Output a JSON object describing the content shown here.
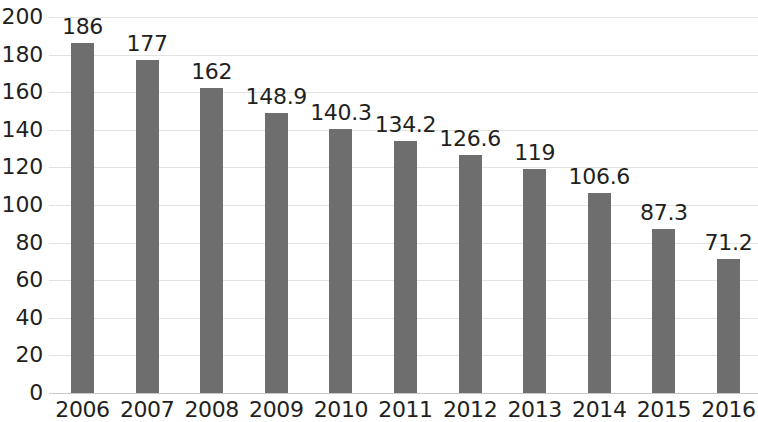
{
  "chart_data": {
    "type": "bar",
    "title": "",
    "subtitle": "",
    "xlabel": "",
    "ylabel": "",
    "categories": [
      "2006",
      "2007",
      "2008",
      "2009",
      "2010",
      "2011",
      "2012",
      "2013",
      "2014",
      "2015",
      "2016"
    ],
    "values": [
      186,
      177,
      162,
      148.9,
      140.3,
      134.2,
      126.6,
      119,
      106.6,
      87.3,
      71.2
    ],
    "value_labels": [
      "186",
      "177",
      "162",
      "148.9",
      "140.3",
      "134.2",
      "126.6",
      "119",
      "106.6",
      "87.3",
      "71.2"
    ],
    "ylim": [
      0,
      200
    ],
    "ytick_step": 20,
    "ytick_labels": [
      "200",
      "180",
      "160",
      "140",
      "120",
      "100",
      "80",
      "60",
      "40",
      "20",
      "0"
    ],
    "ytick_values": [
      200,
      180,
      160,
      140,
      120,
      100,
      80,
      60,
      40,
      20,
      0
    ],
    "grid": true,
    "grid_axis": "y",
    "legend": false,
    "legend_position": "none",
    "bar_color": "#6e6e6e",
    "grid_color": "#e3e3e3",
    "axis_color": "#c9c9c9",
    "text_color": "#231f20",
    "background_color": "#ffffff",
    "data_labels_shown": true,
    "series": [
      {
        "name": "",
        "values": [
          186,
          177,
          162,
          148.9,
          140.3,
          134.2,
          126.6,
          119,
          106.6,
          87.3,
          71.2
        ]
      }
    ]
  }
}
